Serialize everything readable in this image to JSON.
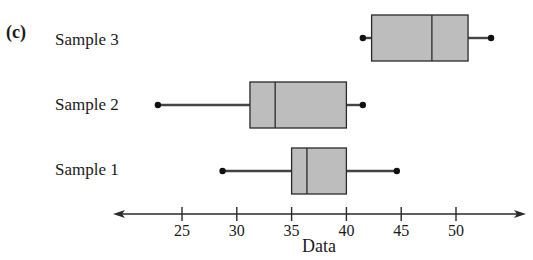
{
  "panel_label": "(c)",
  "colors": {
    "box_fill": "#bdbdbd",
    "stroke": "#2a2a2a",
    "whisker": "#444444"
  },
  "chart_data": {
    "type": "boxplot",
    "title": "",
    "xlabel": "Data",
    "ylabel": "",
    "xlim": [
      19,
      57
    ],
    "xticks": [
      25,
      30,
      35,
      40,
      45,
      50
    ],
    "grid": false,
    "orientation": "horizontal",
    "categories": [
      "Sample 3",
      "Sample 2",
      "Sample 1"
    ],
    "series": [
      {
        "name": "Sample 3",
        "min": 41.5,
        "q1": 42.3,
        "median": 47.8,
        "q3": 51.1,
        "max": 53.2
      },
      {
        "name": "Sample 2",
        "min": 22.8,
        "q1": 31.2,
        "median": 33.5,
        "q3": 40.0,
        "max": 41.5
      },
      {
        "name": "Sample 1",
        "min": 28.7,
        "q1": 35.0,
        "median": 36.4,
        "q3": 40.0,
        "max": 44.6
      }
    ]
  }
}
